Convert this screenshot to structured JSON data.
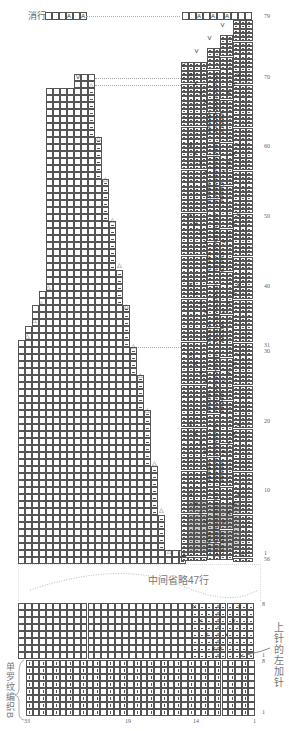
{
  "header": {
    "top_label": "消行",
    "top_row_symbols": [
      "",
      "",
      "",
      "A",
      "",
      "A"
    ]
  },
  "right_panel": {
    "row_labels": [
      {
        "text": "79",
        "y": 16
      },
      {
        "text": "70",
        "y": 77
      },
      {
        "text": "60",
        "y": 146
      },
      {
        "text": "50",
        "y": 216
      },
      {
        "text": "40",
        "y": 286
      },
      {
        "text": "31",
        "y": 345
      },
      {
        "text": "30",
        "y": 351
      },
      {
        "text": "20",
        "y": 421
      },
      {
        "text": "10",
        "y": 490
      },
      {
        "text": "1",
        "y": 553
      },
      {
        "text": "56",
        "y": 559
      }
    ],
    "top_row_symbols": [
      "",
      "",
      "A",
      "",
      "A",
      "",
      "A",
      "",
      "",
      ""
    ]
  },
  "omission": {
    "text": "中间省略47行"
  },
  "bottom_section": {
    "row_labels": [
      {
        "text": "8",
        "y": 604
      },
      {
        "text": "1",
        "y": 655
      },
      {
        "text": "8",
        "y": 661
      },
      {
        "text": "1",
        "y": 712
      }
    ],
    "column_labels": [
      {
        "text": "33",
        "x": 24
      },
      {
        "text": "19",
        "x": 125
      },
      {
        "text": "14",
        "x": 193
      },
      {
        "text": "1",
        "x": 253
      }
    ],
    "left_note": "单罗纹编织B",
    "right_note": "上针的左加针"
  },
  "symbols": {
    "knit_together": "A",
    "slip": "V",
    "decrease": "△",
    "cross": "✕"
  },
  "colors": {
    "grid_line": "#555555",
    "shade": "#c9c9c9",
    "dotted_line": "#aaaaaa"
  }
}
